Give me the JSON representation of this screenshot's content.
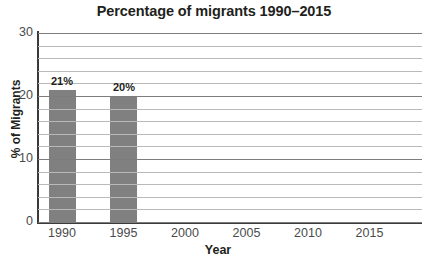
{
  "chart_data": {
    "type": "bar",
    "title": "Percentage of migrants 1990–2015",
    "xlabel": "Year",
    "ylabel": "% of Migrants",
    "categories": [
      "1990",
      "1995",
      "2000",
      "2005",
      "2010",
      "2015"
    ],
    "values": [
      21,
      20,
      null,
      null,
      null,
      null
    ],
    "data_labels": [
      "21%",
      "20%",
      "",
      "",
      "",
      ""
    ],
    "ylim": [
      0,
      30
    ],
    "y_ticks": [
      0,
      10,
      20,
      30
    ],
    "y_tick_labels": [
      "0",
      "10",
      "20",
      "30"
    ],
    "minor_gridline_step": 2,
    "grid": true,
    "legend": "none",
    "bar_color": "#808080",
    "gridline_color": "#7d7d7d",
    "axis_color": "#3a3a3a",
    "text_color": "#231f20",
    "background": "#ffffff"
  }
}
